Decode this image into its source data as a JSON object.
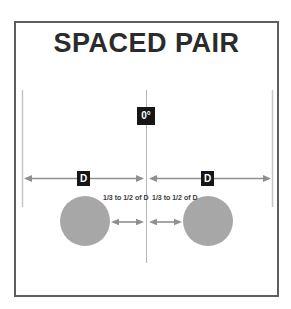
{
  "title": "SPACED PAIR",
  "labels": {
    "angle": "0°",
    "distance_left": "D",
    "distance_right": "D",
    "spacing_left": "1/3 to 1/2 of D",
    "spacing_right": "1/3 to 1/2 of D"
  },
  "colors": {
    "frame_border": "#5e5e5e",
    "title_text": "#2b2b2b",
    "mic_fill": "#a7a7a7",
    "arrow": "#8f8f8f",
    "guide_line": "#c6c6c6",
    "center_line": "#b5b5b5",
    "label_bg": "#161616",
    "label_text": "#ffffff"
  }
}
